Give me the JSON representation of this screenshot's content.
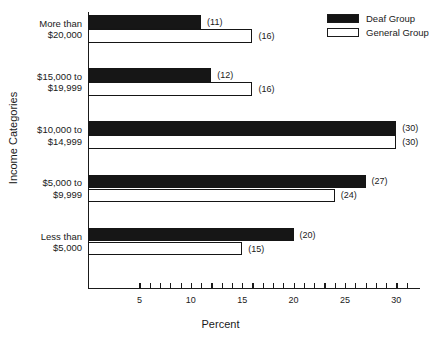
{
  "chart_data": {
    "type": "bar",
    "orientation": "horizontal",
    "title": "",
    "xlabel": "Percent",
    "ylabel": "Income Categories",
    "categories": [
      "Less than\n$5,000",
      "$5,000 to\n$9,999",
      "$10,000 to\n$14,999",
      "$15,000 to\n$19,999",
      "More than\n$20,000"
    ],
    "series": [
      {
        "name": "Deaf Group",
        "values": [
          20,
          27,
          30,
          12,
          11
        ],
        "fill": "#161616"
      },
      {
        "name": "General Group",
        "values": [
          15,
          24,
          30,
          16,
          16
        ],
        "fill": "#ffffff"
      }
    ],
    "value_labels": {
      "Deaf Group": [
        "(20)",
        "(27)",
        "(30)",
        "(12)",
        "(11)"
      ],
      "General Group": [
        "(15)",
        "(24)",
        "(30)",
        "(16)",
        "(16)"
      ]
    },
    "xlim": [
      0,
      32.3
    ],
    "xticks_labeled": [
      5,
      10,
      15,
      20,
      25,
      30
    ],
    "xtick_labels": [
      "5",
      "10",
      "15",
      "20",
      "25",
      "30"
    ],
    "xtick_minor_step": 1,
    "xtick_minor_start": 5,
    "xtick_minor_end": 31,
    "grid": false,
    "legend_position": "top-right"
  },
  "legend": {
    "items": [
      {
        "label": "Deaf Group",
        "swatch": "filled"
      },
      {
        "label": "General Group",
        "swatch": "hollow"
      }
    ]
  },
  "axis": {
    "x_title": "Percent",
    "y_title": "Income Categories"
  }
}
